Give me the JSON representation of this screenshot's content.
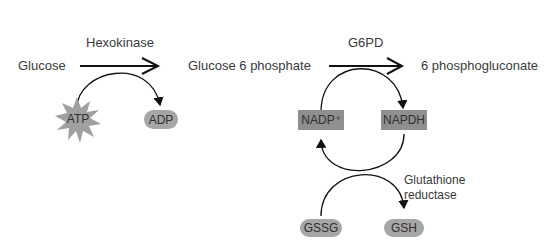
{
  "diagram": {
    "nodes": {
      "glucose": "Glucose",
      "g6p": "Glucose 6 phosphate",
      "pg6": "6 phosphogluconate",
      "atp": "ATP",
      "adp": "ADP",
      "nadp": "NADP⁺",
      "napdh": "NAPDH",
      "gssg": "GSSG",
      "gsh": "GSH"
    },
    "enzymes": {
      "hexokinase": "Hexokinase",
      "g6pd": "G6PD",
      "glutathione_reductase_line1": "Glutathione",
      "glutathione_reductase_line2": "reductase"
    },
    "colors": {
      "arrow": "#111111",
      "rect_fill": "#8f8f8f",
      "pill_fill": "#a6a6a6",
      "star_fill": "#a0a0a0",
      "text": "#3a3a3a"
    }
  }
}
